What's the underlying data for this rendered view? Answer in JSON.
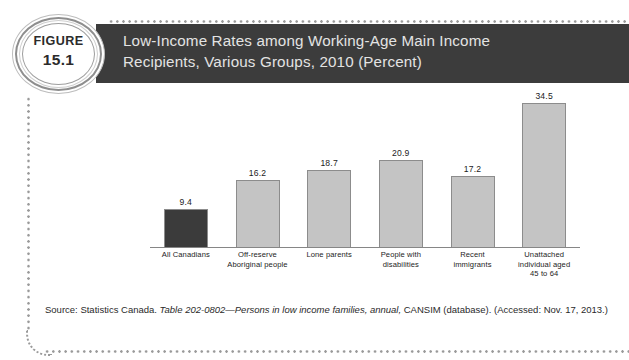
{
  "figure": {
    "badge_label": "FIGURE",
    "badge_number": "15.1",
    "title": "Low-Income Rates among Working-Age Main Income\nRecipients, Various Groups, 2010 (Percent)"
  },
  "colors": {
    "title_bar_bg": "#3c3c3c",
    "title_text": "#e3e3e3",
    "highlight_bar": "#3b3b3b",
    "default_bar": "#c4c4c4",
    "bar_outline": "#8c8c8c",
    "axis_line": "#868686",
    "dotted_frame": "#9a9a9a"
  },
  "source": {
    "prefix": "Source: Statistics Canada. ",
    "italic": "Table 202-0802—Persons in low income families, annual,",
    "suffix": "  CANSIM (database). (Accessed: Nov. 17, 2013.)"
  },
  "chart_data": {
    "type": "bar",
    "title": "Low-Income Rates among Working-Age Main Income Recipients, Various Groups, 2010 (Percent)",
    "xlabel": "",
    "ylabel": "Percent",
    "ylim": [
      0,
      36
    ],
    "grid": false,
    "legend": "none",
    "categories": [
      "All Canadians",
      "Off-reserve\nAboriginal people",
      "Lone parents",
      "People with\ndisabilities",
      "Recent\nimmigrants",
      "Unattached\nindividual aged\n45 to 64"
    ],
    "values": [
      9.4,
      16.2,
      18.7,
      20.9,
      17.2,
      34.5
    ],
    "value_labels": [
      "9.4",
      "16.2",
      "18.7",
      "20.9",
      "17.2",
      "34.5"
    ],
    "bar_colors": [
      "#3b3b3b",
      "#c4c4c4",
      "#c4c4c4",
      "#c4c4c4",
      "#c4c4c4",
      "#c4c4c4"
    ]
  }
}
